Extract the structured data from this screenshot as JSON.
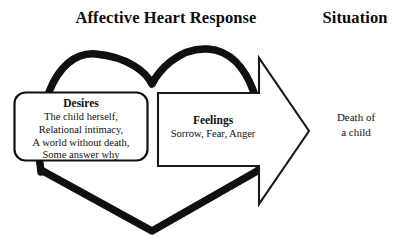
{
  "headings": {
    "left": "Affective Heart Response",
    "right": "Situation"
  },
  "desires_box": {
    "title": "Desires",
    "lines": [
      "The child herself,",
      "Relational intimacy,",
      "A world without death,",
      "Some answer why"
    ]
  },
  "feelings_arrow": {
    "title": "Feelings",
    "lines": [
      "Sorrow, Fear, Anger"
    ]
  },
  "situation": {
    "lines": [
      "Death of",
      "a child"
    ]
  },
  "shapes": {
    "heart_label": "heart-outline-shape",
    "arrow_label": "right-pointing-arrow-shape",
    "box_label": "rounded-rectangle-box"
  },
  "colors": {
    "ink": "#101010",
    "heart_stroke": "#101010",
    "arrow_stroke": "#1a1a1a",
    "box_stroke": "#101010",
    "background": "#ffffff"
  }
}
